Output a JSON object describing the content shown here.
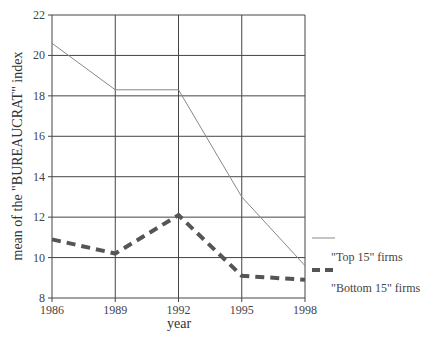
{
  "chart_data": {
    "type": "line",
    "title": "",
    "xlabel": "year",
    "ylabel": "mean of the \"BUREAUCRAT\" index",
    "x": [
      1986,
      1989,
      1992,
      1995,
      1998
    ],
    "x_tick_labels": [
      "1986",
      "1989",
      "1992",
      "1995",
      "1998"
    ],
    "y_tick_labels": [
      "8",
      "10",
      "12",
      "14",
      "16",
      "18",
      "20",
      "22"
    ],
    "ylim": [
      8,
      22
    ],
    "grid": true,
    "legend_position": "right",
    "series": [
      {
        "name": "\"Top 15\" firms",
        "style": "solid",
        "color": "#888888",
        "values": [
          20.6,
          18.3,
          18.3,
          13.0,
          9.6
        ]
      },
      {
        "name": "\"Bottom 15\" firms",
        "style": "dashed",
        "color": "#555555",
        "values": [
          10.9,
          10.2,
          12.1,
          9.1,
          8.9
        ]
      }
    ]
  }
}
